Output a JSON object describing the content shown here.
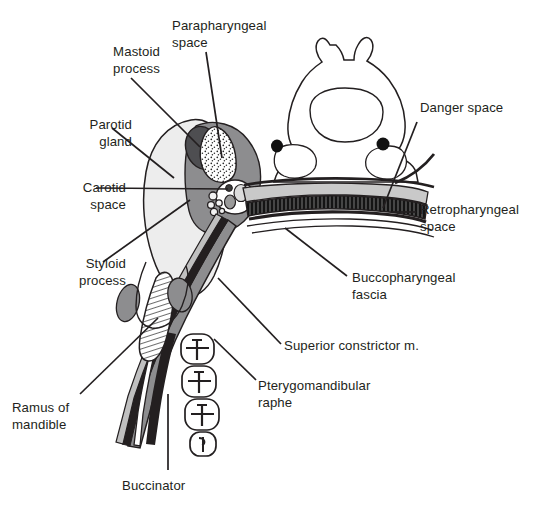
{
  "figure": {
    "type": "anatomical-diagram",
    "background_color": "#ffffff",
    "ink_color": "#231f20"
  },
  "labels": [
    {
      "id": "mastoid-process",
      "text": "Mastoid\nprocess",
      "x": 64,
      "y": 44,
      "w": 96,
      "align": "right"
    },
    {
      "id": "parapharyngeal-space",
      "text": "Parapharyngeal\nspace",
      "x": 172,
      "y": 18,
      "w": 120,
      "align": "left"
    },
    {
      "id": "parotid-gland",
      "text": "Parotid\ngland",
      "x": 36,
      "y": 117,
      "w": 96,
      "align": "right"
    },
    {
      "id": "carotid-space",
      "text": "Carotid\nspace",
      "x": 30,
      "y": 180,
      "w": 96,
      "align": "right"
    },
    {
      "id": "styloid-process",
      "text": "Styloid\nprocess",
      "x": 36,
      "y": 256,
      "w": 90,
      "align": "right"
    },
    {
      "id": "ramus-of-mandible",
      "text": "Ramus of\nmandible",
      "x": 12,
      "y": 400,
      "w": 104,
      "align": "left"
    },
    {
      "id": "buccinator",
      "text": "Buccinator",
      "x": 116,
      "y": 480,
      "w": 100,
      "align": "left"
    },
    {
      "id": "danger-space",
      "text": "Danger space",
      "x": 420,
      "y": 100,
      "w": 120,
      "align": "left"
    },
    {
      "id": "retropharyngeal-space",
      "text": "Retropharyngeal\nspace",
      "x": 420,
      "y": 202,
      "w": 124,
      "align": "left"
    },
    {
      "id": "buccopharyngeal-fascia",
      "text": "Buccopharyngeal\nfascia",
      "x": 350,
      "y": 272,
      "w": 130,
      "align": "left"
    },
    {
      "id": "superior-constrictor",
      "text": "Superior constrictor m.",
      "x": 284,
      "y": 340,
      "w": 190,
      "align": "left"
    },
    {
      "id": "pterygomandibular-raphe",
      "text": "Pterygomandibular\nraphe",
      "x": 258,
      "y": 380,
      "w": 150,
      "align": "left"
    }
  ],
  "structures": [
    {
      "id": "parotid-gland-region",
      "name": "Parotid gland",
      "fill": "#ededed"
    },
    {
      "id": "parapharyngeal-region",
      "name": "Parapharyngeal space",
      "fill": "#ffffff",
      "texture": "stipple"
    },
    {
      "id": "mastoid-process-region",
      "name": "Mastoid process",
      "fill": "#58585b"
    },
    {
      "id": "carotid-space-region",
      "name": "Carotid space",
      "fill": "#ffffff"
    },
    {
      "id": "masticator-region",
      "name": "Masticator / parapharyngeal surround",
      "fill": "#8d8d8f"
    },
    {
      "id": "retropharyngeal-band",
      "name": "Retropharyngeal space",
      "fill": "#c9c9c9"
    },
    {
      "id": "danger-space-band",
      "name": "Danger space",
      "fill": "#1a1a1a"
    },
    {
      "id": "buccopharyngeal-line",
      "name": "Buccopharyngeal fascia",
      "fill": "#231f20"
    },
    {
      "id": "cervical-vertebra",
      "name": "Cervical vertebra",
      "fill": "#ffffff"
    },
    {
      "id": "vertebral-arteries",
      "name": "Vertebral arteries",
      "fill": "#111111"
    },
    {
      "id": "ramus-of-mandible-region",
      "name": "Ramus of mandible",
      "fill": "#ffffff",
      "texture": "hatch"
    },
    {
      "id": "teeth-row",
      "name": "Maxillary teeth",
      "count": 4,
      "fill": "#ffffff"
    },
    {
      "id": "buccinator-muscle",
      "name": "Buccinator muscle",
      "fill": "#231f20"
    },
    {
      "id": "superior-constrictor-muscle",
      "name": "Superior constrictor muscle",
      "fill": "#8d8d8f"
    }
  ]
}
